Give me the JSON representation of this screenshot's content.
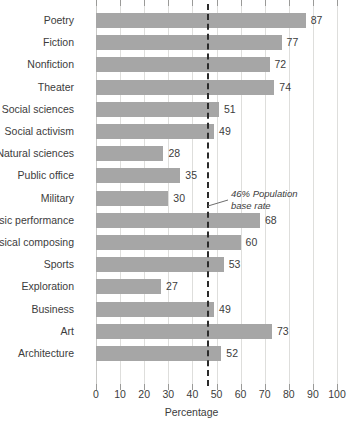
{
  "chart_data": {
    "type": "bar",
    "orientation": "horizontal",
    "title": "",
    "xlabel": "Percentage",
    "ylabel": "",
    "xlim": [
      0,
      100
    ],
    "xticks": [
      0,
      10,
      20,
      30,
      40,
      50,
      60,
      70,
      80,
      90,
      100
    ],
    "grid": true,
    "legend": false,
    "bar_color": "#a6a6a6",
    "categories": [
      "Poetry",
      "Fiction",
      "Nonfiction",
      "Theater",
      "Social sciences",
      "Social activism",
      "Natural sciences",
      "Public office",
      "Military",
      "Music performance",
      "Musical composing",
      "Sports",
      "Exploration",
      "Business",
      "Art",
      "Architecture"
    ],
    "values": [
      87,
      77,
      72,
      74,
      51,
      49,
      28,
      35,
      30,
      68,
      60,
      53,
      27,
      49,
      73,
      52
    ],
    "annotations": [
      {
        "name": "population-base-rate",
        "value": 46,
        "line_1": "46% Population",
        "line_2": "base rate",
        "style": "dashed-vertical-line"
      }
    ]
  }
}
